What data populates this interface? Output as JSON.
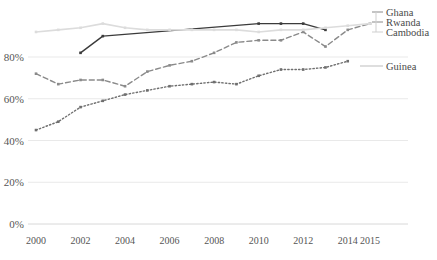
{
  "chart_data": {
    "type": "line",
    "title": "",
    "subtitle": "",
    "xlabel": "",
    "ylabel": "",
    "x": [
      2000,
      2001,
      2002,
      2003,
      2004,
      2005,
      2006,
      2007,
      2008,
      2009,
      2010,
      2011,
      2012,
      2013,
      2014,
      2015
    ],
    "xticks": [
      "2000",
      "2002",
      "2004",
      "2006",
      "2008",
      "2010",
      "2012",
      "2014",
      "2015"
    ],
    "xtick_values": [
      2000,
      2002,
      2004,
      2006,
      2008,
      2010,
      2012,
      2014,
      2015
    ],
    "yticks": [
      "0%",
      "20%",
      "40%",
      "60%",
      "80%"
    ],
    "ytick_values": [
      0,
      20,
      40,
      60,
      80
    ],
    "ylim": [
      0,
      100
    ],
    "xlim": [
      2000,
      2015
    ],
    "grid": true,
    "legend_position": "right",
    "series": [
      {
        "name": "Ghana",
        "style": "solid",
        "color": "#3b3b3b",
        "markers": true,
        "x": [
          2002,
          2003,
          2010,
          2011,
          2012,
          2013
        ],
        "values": [
          82,
          90,
          96,
          96,
          96,
          93
        ]
      },
      {
        "name": "Rwanda",
        "style": "dashed",
        "color": "#8a8a8a",
        "markers": true,
        "x": [
          2000,
          2001,
          2002,
          2003,
          2004,
          2005,
          2006,
          2007,
          2008,
          2009,
          2010,
          2011,
          2012,
          2013,
          2014,
          2015
        ],
        "values": [
          72,
          67,
          69,
          69,
          66,
          73,
          76,
          78,
          82,
          87,
          88,
          88,
          92,
          85,
          93,
          96
        ]
      },
      {
        "name": "Cambodia",
        "style": "solid",
        "color": "#dcdcdc",
        "markers": true,
        "x": [
          2000,
          2001,
          2002,
          2003,
          2004,
          2005,
          2006,
          2007,
          2008,
          2009,
          2010,
          2011,
          2012,
          2013,
          2014,
          2015
        ],
        "values": [
          92,
          93,
          94,
          96,
          94,
          93,
          93,
          93,
          93,
          93,
          92,
          93,
          93,
          94,
          95,
          96
        ]
      },
      {
        "name": "Guinea",
        "style": "dotted",
        "color": "#6f6f6f",
        "markers": true,
        "x": [
          2000,
          2001,
          2002,
          2003,
          2004,
          2005,
          2006,
          2007,
          2008,
          2009,
          2010,
          2011,
          2012,
          2013,
          2014
        ],
        "values": [
          45,
          49,
          56,
          59,
          62,
          64,
          66,
          67,
          68,
          67,
          71,
          74,
          74,
          75,
          78
        ]
      }
    ]
  },
  "legend": {
    "entries": [
      {
        "label": "Ghana"
      },
      {
        "label": "Rwanda"
      },
      {
        "label": "Cambodia"
      },
      {
        "label": "Guinea"
      }
    ]
  }
}
